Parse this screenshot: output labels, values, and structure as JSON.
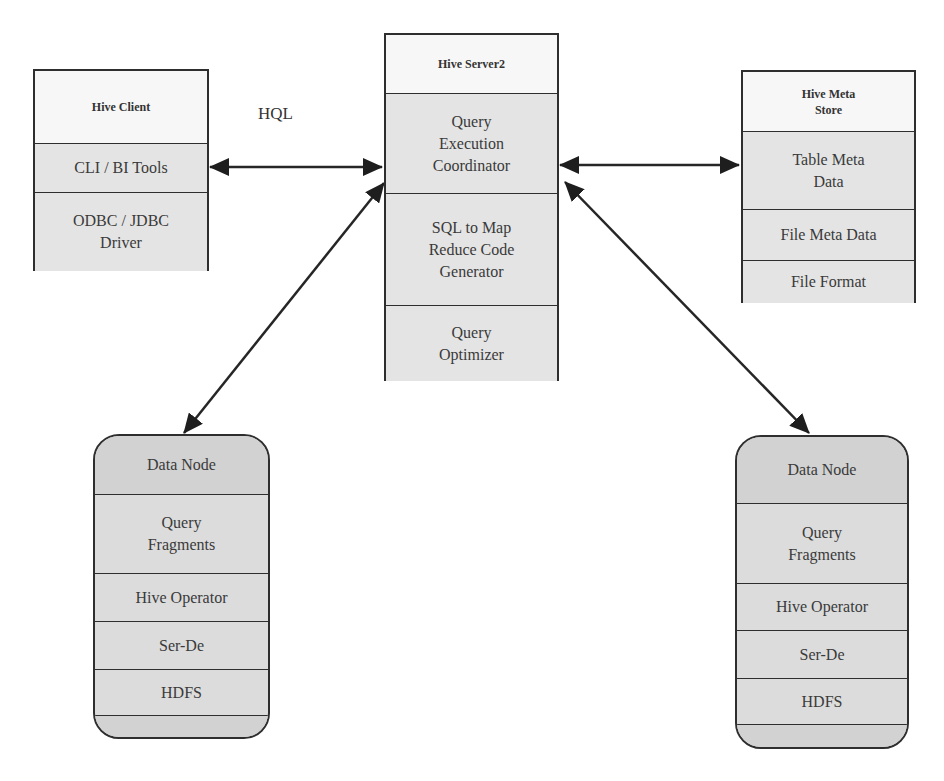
{
  "diagram": {
    "hql_label": "HQL",
    "hive_client": {
      "title": "Hive Client",
      "items": [
        "CLI / BI Tools",
        "ODBC / JDBC\nDriver"
      ]
    },
    "hive_server2": {
      "title": "Hive Server2",
      "items": [
        "Query\nExecution\nCoordinator",
        "SQL to Map\nReduce Code\nGenerator",
        "Query\nOptimizer"
      ]
    },
    "hive_meta_store": {
      "title": "Hive Meta\nStore",
      "items": [
        "Table Meta\nData",
        "File Meta Data",
        "File Format"
      ]
    },
    "data_node_left": {
      "title": "Data Node",
      "items": [
        "Query\nFragments",
        "Hive Operator",
        "Ser-De",
        "HDFS",
        ""
      ]
    },
    "data_node_right": {
      "title": "Data Node",
      "items": [
        "Query\nFragments",
        "Hive Operator",
        "Ser-De",
        "HDFS",
        ""
      ]
    },
    "connections": [
      {
        "from": "Hive Client",
        "to": "Hive Server2",
        "type": "bidirectional",
        "label": "HQL"
      },
      {
        "from": "Hive Server2",
        "to": "Hive Meta Store",
        "type": "bidirectional"
      },
      {
        "from": "Hive Server2",
        "to": "Data Node (left)",
        "type": "bidirectional"
      },
      {
        "from": "Hive Server2",
        "to": "Data Node (right)",
        "type": "bidirectional"
      }
    ],
    "colors": {
      "border": "#2e2e2e",
      "header_fill": "#f7f7f7",
      "cell_fill": "#e4e4e4",
      "node_fill": "#dcdcdc"
    }
  }
}
